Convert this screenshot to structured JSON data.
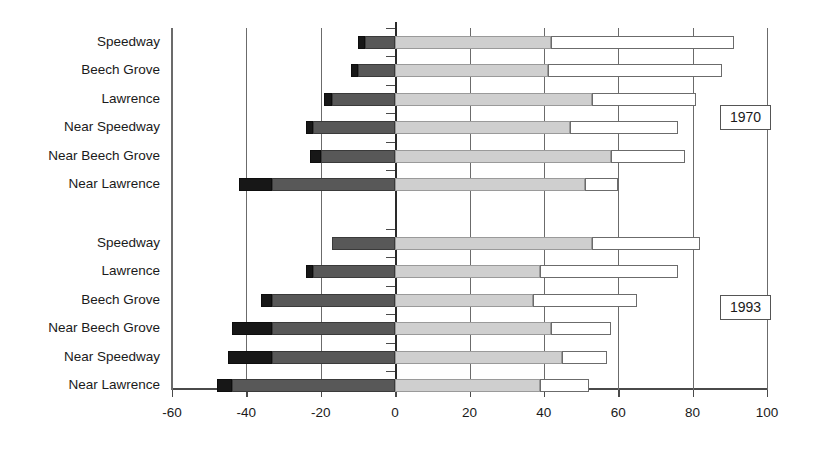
{
  "chart_data": {
    "type": "bar",
    "orientation": "horizontal",
    "subtype": "stacked-diverging",
    "title": "",
    "xlabel": "",
    "ylabel": "",
    "xlim": [
      -60,
      100
    ],
    "xticks": [
      -60,
      -40,
      -20,
      0,
      20,
      40,
      60,
      80,
      100
    ],
    "xticklabels": [
      "-60",
      "-40",
      "-20",
      "0",
      "20",
      "40",
      "60",
      "80",
      "100"
    ],
    "grid": true,
    "gridlines_at": [
      -60,
      -40,
      -20,
      0,
      20,
      40,
      60,
      80,
      100
    ],
    "legend": [],
    "annotations": [
      "1970",
      "1993"
    ],
    "segment_names": [
      "black",
      "dark-gray",
      "light-gray",
      "white"
    ],
    "segment_colors": [
      "#171717",
      "#585858",
      "#cfcfcf",
      "#ffffff"
    ],
    "groups": [
      {
        "name": "1970",
        "categories": [
          "Speedway",
          "Beech Grove",
          "Lawrence",
          "Near Speedway",
          "Near Beech Grove",
          "Near Lawrence"
        ],
        "bars": [
          {
            "category": "Speedway",
            "black_start": -10,
            "dark_start": -8,
            "zero": 0,
            "light_end": 42,
            "white_end": 91
          },
          {
            "category": "Beech Grove",
            "black_start": -12,
            "dark_start": -10,
            "zero": 0,
            "light_end": 41,
            "white_end": 88
          },
          {
            "category": "Lawrence",
            "black_start": -19,
            "dark_start": -17,
            "zero": 0,
            "light_end": 53,
            "white_end": 81
          },
          {
            "category": "Near Speedway",
            "black_start": -24,
            "dark_start": -22,
            "zero": 0,
            "light_end": 47,
            "white_end": 76
          },
          {
            "category": "Near Beech Grove",
            "black_start": -23,
            "dark_start": -20,
            "zero": 0,
            "light_end": 58,
            "white_end": 78
          },
          {
            "category": "Near Lawrence",
            "black_start": -42,
            "dark_start": -33,
            "zero": 0,
            "light_end": 51,
            "white_end": 60
          }
        ]
      },
      {
        "name": "1993",
        "categories": [
          "Speedway",
          "Lawrence",
          "Beech Grove",
          "Near Beech Grove",
          "Near Speedway",
          "Near Lawrence"
        ],
        "bars": [
          {
            "category": "Speedway",
            "black_start": -17,
            "dark_start": -17,
            "zero": 0,
            "light_end": 53,
            "white_end": 82
          },
          {
            "category": "Lawrence",
            "black_start": -24,
            "dark_start": -22,
            "zero": 0,
            "light_end": 39,
            "white_end": 76
          },
          {
            "category": "Beech Grove",
            "black_start": -36,
            "dark_start": -33,
            "zero": 0,
            "light_end": 37,
            "white_end": 65
          },
          {
            "category": "Near Beech Grove",
            "black_start": -44,
            "dark_start": -33,
            "zero": 0,
            "light_end": 42,
            "white_end": 58
          },
          {
            "category": "Near Speedway",
            "black_start": -45,
            "dark_start": -33,
            "zero": 0,
            "light_end": 45,
            "white_end": 57
          },
          {
            "category": "Near Lawrence",
            "black_start": -48,
            "dark_start": -44,
            "zero": 0,
            "light_end": 39,
            "white_end": 52
          }
        ]
      }
    ]
  },
  "axis": {
    "tick_labels": [
      "-60",
      "-40",
      "-20",
      "0",
      "20",
      "40",
      "60",
      "80",
      "100"
    ]
  },
  "row_labels": [
    "Speedway",
    "Beech Grove",
    "Lawrence",
    "Near Speedway",
    "Near Beech Grove",
    "Near Lawrence",
    "Speedway",
    "Lawrence",
    "Beech Grove",
    "Near Beech Grove",
    "Near Speedway",
    "Near Lawrence"
  ],
  "year_badges": {
    "first": "1970",
    "second": "1993"
  }
}
